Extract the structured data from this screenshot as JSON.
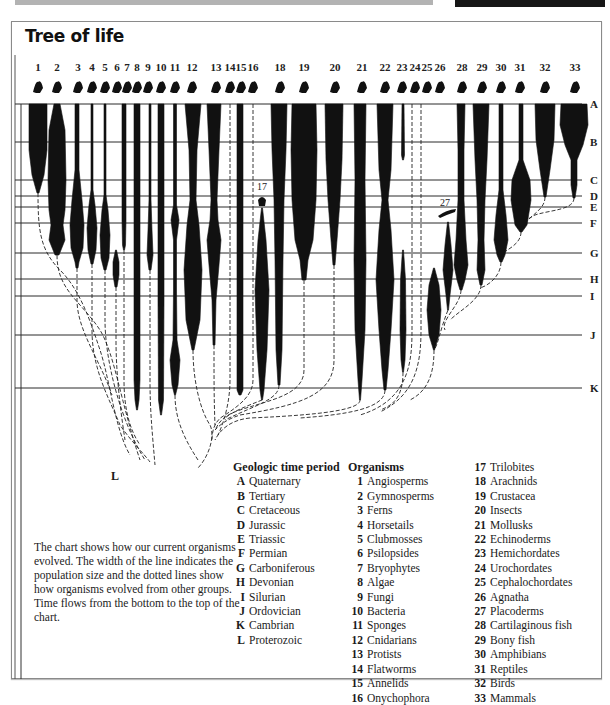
{
  "title": "Tree of life",
  "caption": "The chart shows how our current organisms evolved. The width of the line indicates the population size and the dotted lines show how organisms evolved from other groups. Time flows from the bottom to the top of the chart.",
  "bottom_label": "L",
  "periods_legend": {
    "header": "Geologic time period",
    "items": [
      {
        "key": "A",
        "name": "Quaternary"
      },
      {
        "key": "B",
        "name": "Tertiary"
      },
      {
        "key": "C",
        "name": "Cretaceous"
      },
      {
        "key": "D",
        "name": "Jurassic"
      },
      {
        "key": "E",
        "name": "Triassic"
      },
      {
        "key": "F",
        "name": "Permian"
      },
      {
        "key": "G",
        "name": "Carboniferous"
      },
      {
        "key": "H",
        "name": "Devonian"
      },
      {
        "key": "I",
        "name": "Silurian"
      },
      {
        "key": "J",
        "name": "Ordovician"
      },
      {
        "key": "K",
        "name": "Cambrian"
      },
      {
        "key": "L",
        "name": "Proterozoic"
      }
    ]
  },
  "organisms_legend": {
    "header": "Organisms",
    "items": [
      {
        "num": "1",
        "name": "Angiosperms"
      },
      {
        "num": "2",
        "name": "Gymnosperms"
      },
      {
        "num": "3",
        "name": "Ferns"
      },
      {
        "num": "4",
        "name": "Horsetails"
      },
      {
        "num": "5",
        "name": "Clubmosses"
      },
      {
        "num": "6",
        "name": "Psilopsides"
      },
      {
        "num": "7",
        "name": "Bryophytes"
      },
      {
        "num": "8",
        "name": "Algae"
      },
      {
        "num": "9",
        "name": "Fungi"
      },
      {
        "num": "10",
        "name": "Bacteria"
      },
      {
        "num": "11",
        "name": "Sponges"
      },
      {
        "num": "12",
        "name": "Cnidarians"
      },
      {
        "num": "13",
        "name": "Protists"
      },
      {
        "num": "14",
        "name": "Flatworms"
      },
      {
        "num": "15",
        "name": "Annelids"
      },
      {
        "num": "16",
        "name": "Onychophora"
      },
      {
        "num": "17",
        "name": "Trilobites"
      },
      {
        "num": "18",
        "name": "Arachnids"
      },
      {
        "num": "19",
        "name": "Crustacea"
      },
      {
        "num": "20",
        "name": "Insects"
      },
      {
        "num": "21",
        "name": "Mollusks"
      },
      {
        "num": "22",
        "name": "Echinoderms"
      },
      {
        "num": "23",
        "name": "Hemichordates"
      },
      {
        "num": "24",
        "name": "Urochordates"
      },
      {
        "num": "25",
        "name": "Cephalochordates"
      },
      {
        "num": "26",
        "name": "Agnatha"
      },
      {
        "num": "27",
        "name": "Placoderms"
      },
      {
        "num": "28",
        "name": "Cartilaginous fish"
      },
      {
        "num": "29",
        "name": "Bony fish"
      },
      {
        "num": "30",
        "name": "Amphibians"
      },
      {
        "num": "31",
        "name": "Reptiles"
      },
      {
        "num": "32",
        "name": "Birds"
      },
      {
        "num": "33",
        "name": "Mammals"
      }
    ]
  },
  "chart_data": {
    "type": "diagram",
    "title": "Tree of life",
    "time_axis": "bottom (oldest, L) to top (present, A)",
    "period_lines": [
      {
        "key": "A",
        "y": 104
      },
      {
        "key": "B",
        "y": 142
      },
      {
        "key": "C",
        "y": 180
      },
      {
        "key": "D",
        "y": 196
      },
      {
        "key": "E",
        "y": 207
      },
      {
        "key": "F",
        "y": 223
      },
      {
        "key": "G",
        "y": 253
      },
      {
        "key": "H",
        "y": 279
      },
      {
        "key": "I",
        "y": 296
      },
      {
        "key": "J",
        "y": 335
      },
      {
        "key": "K",
        "y": 388
      }
    ],
    "column_labels": [
      {
        "n": "1",
        "x": 38
      },
      {
        "n": "2",
        "x": 57
      },
      {
        "n": "3",
        "x": 78
      },
      {
        "n": "4",
        "x": 92
      },
      {
        "n": "5",
        "x": 105
      },
      {
        "n": "6",
        "x": 117
      },
      {
        "n": "7",
        "x": 127
      },
      {
        "n": "8",
        "x": 137
      },
      {
        "n": "9",
        "x": 148
      },
      {
        "n": "10",
        "x": 161
      },
      {
        "n": "11",
        "x": 175
      },
      {
        "n": "12",
        "x": 192
      },
      {
        "n": "13",
        "x": 216
      },
      {
        "n": "14",
        "x": 230
      },
      {
        "n": "15",
        "x": 241
      },
      {
        "n": "16",
        "x": 253
      },
      {
        "n": "18",
        "x": 280
      },
      {
        "n": "19",
        "x": 304
      },
      {
        "n": "20",
        "x": 335
      },
      {
        "n": "21",
        "x": 362
      },
      {
        "n": "22",
        "x": 385
      },
      {
        "n": "23",
        "x": 402
      },
      {
        "n": "24",
        "x": 415
      },
      {
        "n": "25",
        "x": 427
      },
      {
        "n": "26",
        "x": 440
      },
      {
        "n": "28",
        "x": 462
      },
      {
        "n": "29",
        "x": 482
      },
      {
        "n": "30",
        "x": 501
      },
      {
        "n": "31",
        "x": 520
      },
      {
        "n": "32",
        "x": 545
      },
      {
        "n": "33",
        "x": 575
      }
    ],
    "inline_labels": [
      {
        "n": "17",
        "x": 262,
        "y": 190
      },
      {
        "n": "27",
        "x": 445,
        "y": 206
      }
    ],
    "lineages": [
      {
        "n": "1",
        "x": 38,
        "profile": [
          [
            104,
            9
          ],
          [
            150,
            9
          ],
          [
            175,
            6
          ],
          [
            193,
            1
          ]
        ]
      },
      {
        "n": "2",
        "x": 57,
        "profile": [
          [
            104,
            3
          ],
          [
            130,
            8
          ],
          [
            180,
            9
          ],
          [
            210,
            8
          ],
          [
            225,
            6
          ],
          [
            240,
            8
          ],
          [
            255,
            2
          ]
        ]
      },
      {
        "n": "3",
        "x": 77,
        "profile": [
          [
            104,
            2
          ],
          [
            170,
            2
          ],
          [
            200,
            5
          ],
          [
            225,
            7
          ],
          [
            248,
            6
          ],
          [
            262,
            2
          ],
          [
            268,
            1
          ]
        ]
      },
      {
        "n": "4",
        "x": 92,
        "profile": [
          [
            104,
            1
          ],
          [
            190,
            1
          ],
          [
            205,
            3
          ],
          [
            228,
            5
          ],
          [
            250,
            4
          ],
          [
            264,
            1
          ]
        ]
      },
      {
        "n": "5",
        "x": 105,
        "profile": [
          [
            104,
            1
          ],
          [
            195,
            1
          ],
          [
            210,
            3
          ],
          [
            235,
            5
          ],
          [
            258,
            4
          ],
          [
            270,
            1
          ]
        ]
      },
      {
        "n": "6",
        "x": 116,
        "profile": [
          [
            250,
            0.5
          ],
          [
            262,
            3
          ],
          [
            275,
            3
          ],
          [
            287,
            1
          ]
        ]
      },
      {
        "n": "7",
        "x": 124,
        "profile": [
          [
            104,
            2
          ],
          [
            220,
            2
          ],
          [
            245,
            1.5
          ],
          [
            250,
            0.5
          ]
        ]
      },
      {
        "n": "8",
        "x": 137,
        "profile": [
          [
            104,
            3
          ],
          [
            300,
            3
          ],
          [
            380,
            3
          ],
          [
            400,
            2
          ],
          [
            410,
            0.5
          ]
        ]
      },
      {
        "n": "9",
        "x": 150,
        "profile": [
          [
            104,
            1
          ],
          [
            200,
            1
          ],
          [
            230,
            2
          ],
          [
            255,
            3
          ],
          [
            270,
            1
          ]
        ]
      },
      {
        "n": "10",
        "x": 161,
        "profile": [
          [
            104,
            3
          ],
          [
            300,
            3
          ],
          [
            400,
            2.5
          ],
          [
            415,
            0.5
          ]
        ]
      },
      {
        "n": "11",
        "x": 175,
        "profile": [
          [
            104,
            1.5
          ],
          [
            205,
            1.5
          ],
          [
            220,
            4
          ],
          [
            240,
            1.5
          ],
          [
            290,
            1.5
          ],
          [
            340,
            2
          ],
          [
            360,
            5
          ],
          [
            385,
            3
          ],
          [
            395,
            0.5
          ]
        ]
      },
      {
        "n": "12",
        "x": 193,
        "profile": [
          [
            104,
            8
          ],
          [
            150,
            4
          ],
          [
            200,
            3
          ],
          [
            225,
            6
          ],
          [
            270,
            9
          ],
          [
            320,
            7
          ],
          [
            345,
            2
          ],
          [
            350,
            1
          ]
        ]
      },
      {
        "n": "13",
        "x": 214,
        "profile": [
          [
            104,
            7
          ],
          [
            150,
            5
          ],
          [
            200,
            3
          ],
          [
            220,
            4
          ],
          [
            240,
            7
          ],
          [
            265,
            5
          ],
          [
            300,
            2
          ],
          [
            345,
            1
          ]
        ]
      },
      {
        "n": "15",
        "x": 240,
        "profile": [
          [
            104,
            3
          ],
          [
            390,
            3
          ],
          [
            395,
            1
          ]
        ]
      },
      {
        "n": "17",
        "x": 262,
        "profile": [
          [
            208,
            0.5
          ],
          [
            240,
            4
          ],
          [
            290,
            7
          ],
          [
            350,
            5
          ],
          [
            390,
            2
          ],
          [
            400,
            0.5
          ]
        ]
      },
      {
        "n": "18",
        "x": 279,
        "profile": [
          [
            104,
            8
          ],
          [
            150,
            7
          ],
          [
            200,
            5
          ],
          [
            260,
            4
          ],
          [
            350,
            3
          ],
          [
            385,
            1
          ]
        ]
      },
      {
        "n": "19",
        "x": 304,
        "profile": [
          [
            104,
            12
          ],
          [
            150,
            13
          ],
          [
            200,
            12
          ],
          [
            240,
            9
          ],
          [
            260,
            4
          ],
          [
            280,
            2
          ]
        ]
      },
      {
        "n": "20",
        "x": 334,
        "profile": [
          [
            104,
            9
          ],
          [
            160,
            8
          ],
          [
            200,
            6
          ],
          [
            240,
            3
          ],
          [
            265,
            1
          ]
        ]
      },
      {
        "n": "21",
        "x": 360,
        "profile": [
          [
            104,
            6
          ],
          [
            180,
            5
          ],
          [
            260,
            6
          ],
          [
            330,
            5
          ],
          [
            380,
            2
          ],
          [
            400,
            0.5
          ]
        ]
      },
      {
        "n": "22",
        "x": 385,
        "profile": [
          [
            104,
            8
          ],
          [
            170,
            6
          ],
          [
            200,
            3
          ],
          [
            230,
            6
          ],
          [
            280,
            9
          ],
          [
            330,
            6
          ],
          [
            370,
            3
          ],
          [
            390,
            1
          ]
        ]
      },
      {
        "n": "23",
        "x": 403,
        "profile": [
          [
            104,
            1
          ],
          [
            155,
            1.5
          ],
          [
            160,
            0.5
          ]
        ]
      },
      {
        "n": "24",
        "x": 403,
        "profile": [
          [
            250,
            0.5
          ],
          [
            280,
            2.5
          ],
          [
            330,
            3
          ],
          [
            360,
            2
          ],
          [
            372,
            0.5
          ]
        ]
      },
      {
        "n": "26",
        "x": 434,
        "profile": [
          [
            268,
            0.5
          ],
          [
            285,
            5
          ],
          [
            310,
            7
          ],
          [
            335,
            5
          ],
          [
            350,
            0.5
          ]
        ]
      },
      {
        "n": "27",
        "x": 448,
        "profile": [
          [
            222,
            0.5
          ],
          [
            245,
            3
          ],
          [
            270,
            5
          ],
          [
            295,
            2
          ],
          [
            310,
            0.5
          ]
        ]
      },
      {
        "n": "28",
        "x": 461,
        "profile": [
          [
            104,
            4
          ],
          [
            150,
            3
          ],
          [
            200,
            3
          ],
          [
            240,
            5
          ],
          [
            265,
            7
          ],
          [
            280,
            4
          ],
          [
            290,
            1
          ]
        ]
      },
      {
        "n": "29",
        "x": 481,
        "profile": [
          [
            104,
            8
          ],
          [
            160,
            6
          ],
          [
            200,
            4
          ],
          [
            240,
            3
          ],
          [
            270,
            4
          ],
          [
            285,
            1
          ]
        ]
      },
      {
        "n": "30",
        "x": 501,
        "profile": [
          [
            104,
            2
          ],
          [
            190,
            2
          ],
          [
            215,
            5
          ],
          [
            240,
            7
          ],
          [
            255,
            4
          ],
          [
            262,
            1
          ]
        ]
      },
      {
        "n": "31",
        "x": 521,
        "profile": [
          [
            104,
            2
          ],
          [
            160,
            2
          ],
          [
            180,
            9
          ],
          [
            200,
            10
          ],
          [
            225,
            6
          ],
          [
            232,
            1
          ]
        ]
      },
      {
        "n": "32",
        "x": 545,
        "profile": [
          [
            104,
            10
          ],
          [
            140,
            9
          ],
          [
            170,
            5
          ],
          [
            190,
            2
          ],
          [
            197,
            1
          ]
        ]
      },
      {
        "n": "33",
        "x": 574,
        "profile": [
          [
            104,
            13
          ],
          [
            125,
            14
          ],
          [
            145,
            9
          ],
          [
            160,
            3
          ],
          [
            185,
            3
          ],
          [
            198,
            1
          ]
        ]
      }
    ],
    "dashed_links": [
      "M38,193 C38,230 40,250 60,270 C80,290 90,320 100,350 C110,380 115,430 130,455",
      "M57,255 C57,290 80,300 100,330 C115,355 120,400 140,460",
      "M77,268 L77,300 C77,330 100,360 112,395",
      "M92,264 L92,330 C92,370 110,400 120,425 C130,440 145,455 150,462",
      "M105,270 L105,320 C105,360 120,420 145,460",
      "M116,287 L116,340 C116,380 122,420 125,440",
      "M124,250 L124,380 C124,410 130,430 140,445",
      "M150,270 L150,380 C150,410 152,430 155,465",
      "M175,395 C175,420 185,440 198,460",
      "M193,350 C193,380 200,410 210,425 C215,435 210,455 198,468",
      "M214,345 C214,380 214,400 215,425",
      "M230,104 L230,380 C230,400 225,420 218,435",
      "M253,104 L253,380 C253,395 240,405 225,415 C215,420 212,430 212,440",
      "M262,400 C250,405 235,410 225,418",
      "M279,385 C279,400 255,405 225,420",
      "M304,280 L304,370 C304,395 270,400 240,410 C225,415 220,420 215,430",
      "M334,265 L334,360 C334,395 300,405 240,415 C225,420 220,425 215,430",
      "M360,400 C360,410 320,415 250,418 C230,420 220,430 215,440",
      "M385,390 C385,410 340,415 300,418",
      "M412,104 L412,330 C412,360 410,400 360,415",
      "M421,104 L421,330 C421,365 415,395 380,412",
      "M403,372 C403,395 395,405 380,410",
      "M434,350 C434,370 430,390 410,400",
      "M448,310 C440,330 438,345 434,350",
      "M461,290 C461,305 440,320 445,330",
      "M481,285 C481,300 460,310 450,320",
      "M501,262 C501,275 490,285 480,288",
      "M521,232 C521,245 505,250 501,255",
      "M545,197 C545,210 530,215 524,225",
      "M574,198 C574,210 550,210 535,215 C525,220 521,225 521,230"
    ]
  }
}
